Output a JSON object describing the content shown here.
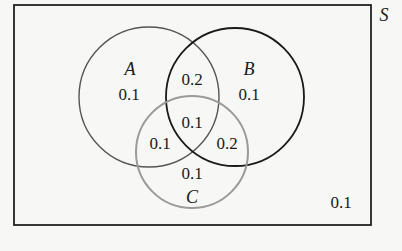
{
  "diagram": {
    "type": "venn",
    "universe": {
      "label": "S",
      "outside_value": "0.1"
    },
    "sets": [
      {
        "name": "A",
        "only_value": "0.1",
        "stroke": "#555555"
      },
      {
        "name": "B",
        "only_value": "0.1",
        "stroke": "#1a1a1a"
      },
      {
        "name": "C",
        "only_value": "0.1",
        "stroke": "#9a9a9a"
      }
    ],
    "intersections": {
      "A_and_B_only": "0.2",
      "A_and_C_only": "0.1",
      "B_and_C_only": "0.2",
      "A_and_B_and_C": "0.1"
    }
  }
}
